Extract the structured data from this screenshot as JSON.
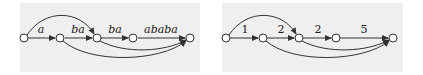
{
  "diagrams": [
    {
      "id": "left",
      "node_count": 5,
      "edge_labels": [
        "a",
        "ba",
        "ba",
        "ababa"
      ],
      "skip_edges": [
        "node1-node3",
        "node2-node5",
        "node3-node5"
      ]
    },
    {
      "id": "right",
      "node_count": 5,
      "edge_labels": [
        "1",
        "2",
        "2",
        "5"
      ],
      "skip_edges": [
        "node1-node3",
        "node2-node5",
        "node3-node5"
      ]
    }
  ],
  "colors": {
    "panel_bg": "#efefef",
    "stroke": "#333333",
    "node_fill": "#ffffff"
  }
}
